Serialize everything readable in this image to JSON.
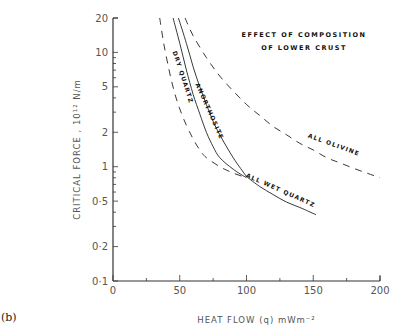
{
  "panel_label": "(b)",
  "chart_data": {
    "type": "line",
    "title_lines": [
      "EFFECT OF COMPOSITION",
      "OF LOWER CRUST"
    ],
    "xlabel": "HEAT FLOW (q) mWm⁻²",
    "ylabel": "CRITICAL FORCE , 10¹² N/m",
    "xlim": [
      0,
      200
    ],
    "ylim": [
      0.1,
      20
    ],
    "yscale": "log",
    "xticks": [
      0,
      50,
      100,
      150,
      200
    ],
    "xtick_labels": [
      "0",
      "50",
      "100",
      "150",
      "200"
    ],
    "yticks": [
      0.1,
      0.2,
      0.5,
      1,
      2,
      5,
      10,
      20
    ],
    "ytick_labels": [
      "0·1",
      "0·2",
      "0·5",
      "1",
      "2",
      "5",
      "10",
      "20"
    ],
    "grid": false,
    "legend": "inline curve labels",
    "series": [
      {
        "name": "DRY QUARTZ",
        "style": "solid",
        "x": [
          45,
          50,
          55,
          60,
          65,
          70,
          75,
          80,
          90,
          100
        ],
        "y": [
          20,
          12,
          7.0,
          4.3,
          2.9,
          2.0,
          1.5,
          1.2,
          0.95,
          0.8
        ]
      },
      {
        "name": "ANORTHOSITE",
        "style": "solid",
        "x": [
          49,
          55,
          60,
          65,
          70,
          75,
          80,
          90,
          100
        ],
        "y": [
          20,
          12,
          7.5,
          5.0,
          3.5,
          2.5,
          1.9,
          1.2,
          0.82
        ]
      },
      {
        "name": "ALL WET QUARTZ",
        "style": "solid",
        "x": [
          100,
          110,
          120,
          130,
          140,
          152
        ],
        "y": [
          0.82,
          0.67,
          0.57,
          0.49,
          0.44,
          0.38
        ]
      },
      {
        "name": "ALL OLIVINE",
        "style": "dashed",
        "x": [
          54,
          60,
          70,
          80,
          90,
          100,
          110,
          120,
          130,
          140,
          150,
          160,
          170,
          180,
          190,
          200
        ],
        "y": [
          20,
          14,
          9.0,
          6.2,
          4.6,
          3.5,
          2.8,
          2.25,
          1.9,
          1.6,
          1.4,
          1.2,
          1.08,
          0.97,
          0.88,
          0.8
        ]
      },
      {
        "name": "(unlabelled lower bound)",
        "style": "dashed",
        "x": [
          35,
          38,
          42,
          46,
          50,
          55,
          60,
          65,
          70,
          80,
          90,
          100
        ],
        "y": [
          20,
          12,
          7,
          4.5,
          3.2,
          2.3,
          1.75,
          1.4,
          1.2,
          1.0,
          0.88,
          0.8
        ]
      }
    ],
    "annotations": [
      {
        "text": "DRY QUARTZ",
        "x": 51,
        "y": 6
      },
      {
        "text": "ANORTHOSITE",
        "x": 71,
        "y": 3
      },
      {
        "text": "ALL WET QUARTZ",
        "x": 125,
        "y": 0.6
      },
      {
        "text": "ALL OLIVINE",
        "x": 165,
        "y": 1.5
      }
    ]
  }
}
